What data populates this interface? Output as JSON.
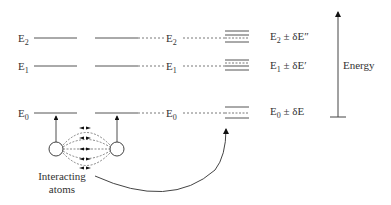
{
  "diagram": {
    "left_levels": [
      {
        "label": "E",
        "sub": "2",
        "y": 38
      },
      {
        "label": "E",
        "sub": "1",
        "y": 66
      },
      {
        "label": "E",
        "sub": "0",
        "y": 113
      }
    ],
    "middle_levels": [
      {
        "label": "E",
        "sub": "2",
        "y": 38
      },
      {
        "label": "E",
        "sub": "1",
        "y": 66
      },
      {
        "label": "E",
        "sub": "0",
        "y": 113
      }
    ],
    "split_labels": [
      {
        "base": "E",
        "sub": "2",
        "rest": " ± δE″",
        "y": 38
      },
      {
        "base": "E",
        "sub": "1",
        "rest": " ± δE′",
        "y": 66
      },
      {
        "base": "E",
        "sub": "0",
        "rest": " ± δE",
        "y": 113
      }
    ],
    "axis_label": "Energy",
    "atoms_label_line1": "Interacting",
    "atoms_label_line2": "atoms",
    "colors": {
      "line": "#555555",
      "text": "#333333",
      "arrow": "#111111"
    }
  }
}
